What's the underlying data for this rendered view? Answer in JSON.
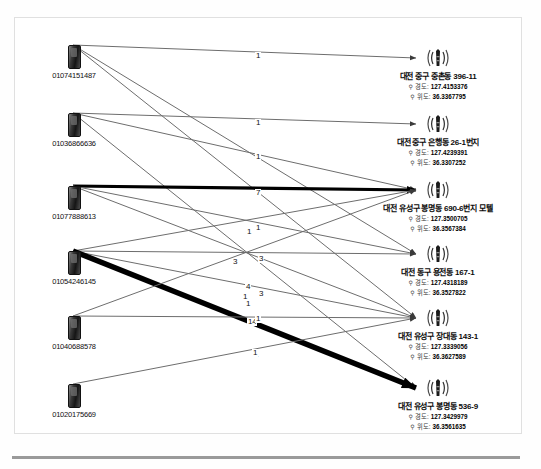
{
  "diagram": {
    "title_visible": false,
    "type": "bipartite-call-link-graph",
    "sources": [
      {
        "id": "s1",
        "label": "01074151487",
        "icon": "mobile-phone-icon",
        "x": 73,
        "y": 45
      },
      {
        "id": "s2",
        "label": "01036866636",
        "icon": "mobile-phone-icon",
        "x": 73,
        "y": 113
      },
      {
        "id": "s3",
        "label": "01077888613",
        "icon": "mobile-phone-icon",
        "x": 73,
        "y": 186
      },
      {
        "id": "s4",
        "label": "01054246145",
        "icon": "mobile-phone-icon",
        "x": 73,
        "y": 251
      },
      {
        "id": "s5",
        "label": "01040688578",
        "icon": "mobile-phone-icon",
        "x": 73,
        "y": 316
      },
      {
        "id": "s6",
        "label": "01020175669",
        "icon": "mobile-phone-icon",
        "x": 73,
        "y": 384
      }
    ],
    "targets": [
      {
        "id": "t1",
        "icon": "cell-tower-icon",
        "address": "대전 중구 중촌동 396-11",
        "lon_key": "경도:",
        "lon_val": "127.4153376",
        "lat_key": "위도:",
        "lat_val": "36.3367795",
        "x": 438,
        "y": 58
      },
      {
        "id": "t2",
        "icon": "cell-tower-icon",
        "address": "대전 중구 은행동 26-1번지",
        "lon_key": "경도:",
        "lon_val": "127.4239391",
        "lat_key": "위도:",
        "lat_val": "36.3307252",
        "x": 438,
        "y": 124
      },
      {
        "id": "t3",
        "icon": "cell-tower-icon",
        "address": "대전 유성구 봉명동 690-6번지 모텔",
        "lon_key": "경도:",
        "lon_val": "127.3500705",
        "lat_key": "위도:",
        "lat_val": "36.3567384",
        "x": 438,
        "y": 190
      },
      {
        "id": "t4",
        "icon": "cell-tower-icon",
        "address": "대전 동구 용전동 167-1",
        "lon_key": "경도:",
        "lon_val": "127.4318189",
        "lat_key": "위도:",
        "lat_val": "36.3527822",
        "x": 438,
        "y": 254
      },
      {
        "id": "t5",
        "icon": "cell-tower-icon",
        "address": "대전 유성구 장대동 143-1",
        "lon_key": "경도:",
        "lon_val": "127.3339056",
        "lat_key": "위도:",
        "lat_val": "36.3627589",
        "x": 438,
        "y": 318
      },
      {
        "id": "t6",
        "icon": "cell-tower-icon",
        "address": "대전 유성구 봉명동 536-9",
        "lon_key": "경도:",
        "lon_val": "127.3429979",
        "lat_key": "위도:",
        "lat_val": "36.3561635",
        "x": 438,
        "y": 388
      }
    ],
    "edges": [
      {
        "from": "s1",
        "to": "t1",
        "weight": "1",
        "thickness": 1.0,
        "label_x": 255,
        "label_y": 56
      },
      {
        "from": "s1",
        "to": "t4",
        "weight": "3",
        "thickness": 1.0,
        "label_x": 232,
        "label_y": 262
      },
      {
        "from": "s1",
        "to": "t5",
        "weight": "1",
        "thickness": 1.0,
        "label_x": 242,
        "label_y": 297
      },
      {
        "from": "s2",
        "to": "t2",
        "weight": "1",
        "thickness": 1.0,
        "label_x": 255,
        "label_y": 123
      },
      {
        "from": "s2",
        "to": "t3",
        "weight": "1",
        "thickness": 1.0,
        "label_x": 255,
        "label_y": 157
      },
      {
        "from": "s2",
        "to": "t6",
        "weight": "1",
        "thickness": 1.0,
        "label_x": 253,
        "label_y": 355
      },
      {
        "from": "s3",
        "to": "t3",
        "weight": "7",
        "thickness": 3.2,
        "label_x": 255,
        "label_y": 193
      },
      {
        "from": "s3",
        "to": "t4",
        "weight": "1",
        "thickness": 1.0,
        "label_x": 255,
        "label_y": 228
      },
      {
        "from": "s3",
        "to": "t5",
        "weight": "1",
        "thickness": 1.0,
        "label_x": 245,
        "label_y": 304
      },
      {
        "from": "s4",
        "to": "t3",
        "weight": "3",
        "thickness": 1.0,
        "label_x": 258,
        "label_y": 259
      },
      {
        "from": "s4",
        "to": "t4",
        "weight": "4",
        "thickness": 1.0,
        "label_x": 245,
        "label_y": 287
      },
      {
        "from": "s4",
        "to": "t5",
        "weight": "3",
        "thickness": 1.0,
        "label_x": 258,
        "label_y": 294
      },
      {
        "from": "s4",
        "to": "t6",
        "weight": "14",
        "thickness": 5.5,
        "label_x": 247,
        "label_y": 322
      },
      {
        "from": "s5",
        "to": "t3",
        "weight": "1",
        "thickness": 1.0,
        "label_x": 246,
        "label_y": 232
      },
      {
        "from": "s5",
        "to": "t5",
        "weight": "1",
        "thickness": 1.0,
        "label_x": 255,
        "label_y": 319
      },
      {
        "from": "s6",
        "to": "t5",
        "weight": "1",
        "thickness": 1.0,
        "label_x": 252,
        "label_y": 353
      }
    ],
    "style": {
      "edge_color": "#6d6d6d",
      "thick_edge_color": "#000000",
      "node_label_color": "#111111",
      "background": "#ffffff",
      "frame_color": "#e0e0e0",
      "rule_color": "#9a9a9a"
    }
  }
}
